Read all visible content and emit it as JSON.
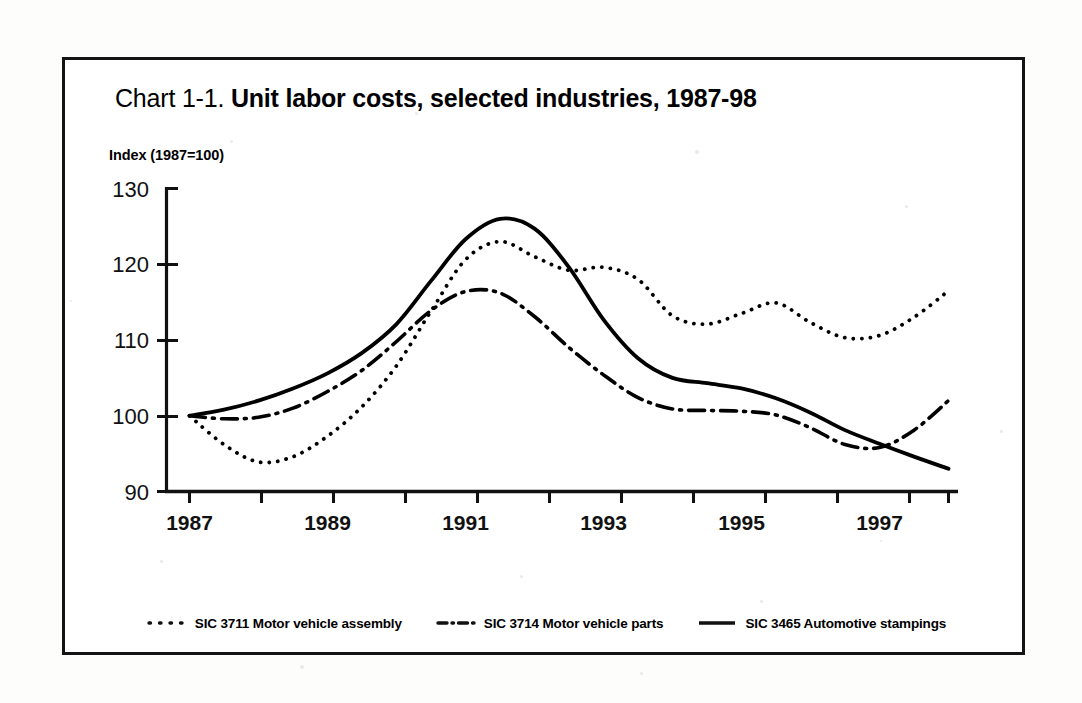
{
  "figure": {
    "title_prefix": "Chart 1-1. ",
    "title_main": "Unit labor costs, selected industries, 1987-98",
    "axis_note": "Index (1987=100)"
  },
  "legend": {
    "items": [
      {
        "label": "SIC 3711 Motor vehicle assembly",
        "style": "dotted",
        "swatch": "dotted-line-icon"
      },
      {
        "label": "SIC 3714 Motor vehicle parts",
        "style": "dashdot",
        "swatch": "dash-dot-line-icon"
      },
      {
        "label": "SIC 3465 Automotive stampings",
        "style": "solid",
        "swatch": "solid-line-icon"
      }
    ]
  },
  "chart_data": {
    "type": "line",
    "title": "Chart 1-1. Unit labor costs, selected industries, 1987-98",
    "xlabel": "",
    "ylabel": "Index (1987=100)",
    "xlim": [
      1987,
      1998
    ],
    "ylim": [
      90,
      130
    ],
    "ytick_step": 10,
    "yticks": [
      90,
      100,
      110,
      120,
      130
    ],
    "xticks": [
      1987,
      1988,
      1989,
      1990,
      1991,
      1992,
      1993,
      1994,
      1995,
      1996,
      1997,
      1998
    ],
    "xtick_labels": [
      "1987",
      "",
      "1989",
      "",
      "1991",
      "",
      "1993",
      "",
      "1995",
      "",
      "1997",
      ""
    ],
    "xtick_labels_shown": [
      "1987",
      "1989",
      "1991",
      "1993",
      "1995",
      "1997"
    ],
    "grid": false,
    "legend_position": "bottom",
    "line_color": "#000000",
    "x": [
      1987,
      1987.5,
      1988,
      1988.5,
      1989,
      1989.5,
      1990,
      1990.5,
      1991,
      1991.5,
      1992,
      1992.5,
      1993,
      1993.5,
      1994,
      1994.5,
      1995,
      1995.5,
      1996,
      1996.5,
      1997,
      1997.5,
      1998
    ],
    "series": [
      {
        "name": "SIC 3711 Motor vehicle assembly",
        "style": "dotted",
        "values": [
          100.0,
          96.2,
          93.9,
          94.6,
          97.3,
          101.2,
          106.6,
          113.8,
          120.6,
          123.0,
          121.0,
          119.2,
          119.6,
          118.0,
          113.2,
          112.1,
          113.5,
          114.9,
          112.3,
          110.3,
          110.6,
          113.0,
          116.5
        ]
      },
      {
        "name": "SIC 3714 Motor vehicle parts",
        "style": "dashdot",
        "values": [
          100.0,
          99.6,
          99.8,
          101.0,
          103.2,
          106.0,
          109.8,
          113.9,
          116.4,
          116.2,
          113.1,
          109.0,
          105.4,
          102.4,
          100.9,
          100.7,
          100.6,
          100.1,
          98.4,
          96.2,
          95.8,
          98.1,
          102.0
        ]
      },
      {
        "name": "SIC 3465 Automotive stampings",
        "style": "solid",
        "values": [
          100.0,
          100.8,
          102.0,
          103.6,
          105.6,
          108.3,
          112.1,
          117.8,
          123.3,
          126.0,
          124.7,
          119.6,
          112.7,
          107.6,
          105.0,
          104.3,
          103.6,
          102.3,
          100.4,
          98.1,
          96.3,
          94.6,
          93.0
        ]
      }
    ]
  }
}
